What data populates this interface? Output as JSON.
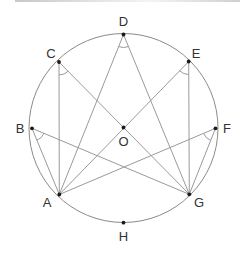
{
  "diagram": {
    "type": "inscribed-angles-circle",
    "circle": {
      "center_label": "O",
      "cx": 123.5,
      "cy": 128,
      "r": 94.5
    },
    "points": [
      {
        "label": "A",
        "x": 59.3,
        "y": 194.5,
        "lx": 47,
        "ly": 207
      },
      {
        "label": "B",
        "x": 32,
        "y": 128.3,
        "lx": 20,
        "ly": 133
      },
      {
        "label": "C",
        "x": 59,
        "y": 62,
        "lx": 51,
        "ly": 58
      },
      {
        "label": "D",
        "x": 123.5,
        "y": 34.5,
        "lx": 123.5,
        "ly": 26
      },
      {
        "label": "E",
        "x": 188.7,
        "y": 61.5,
        "lx": 196,
        "ly": 58
      },
      {
        "label": "F",
        "x": 215.5,
        "y": 128.3,
        "lx": 227,
        "ly": 133
      },
      {
        "label": "G",
        "x": 189.3,
        "y": 194.3,
        "lx": 199,
        "ly": 207
      },
      {
        "label": "H",
        "x": 123.5,
        "y": 222.7,
        "lx": 123.5,
        "ly": 241
      },
      {
        "label": "O",
        "x": 123.5,
        "y": 127.5,
        "lx": 123.5,
        "ly": 146
      }
    ],
    "segments": [
      [
        "D",
        "A"
      ],
      [
        "D",
        "G"
      ],
      [
        "C",
        "A"
      ],
      [
        "C",
        "G"
      ],
      [
        "E",
        "A"
      ],
      [
        "E",
        "G"
      ],
      [
        "B",
        "A"
      ],
      [
        "B",
        "G"
      ],
      [
        "F",
        "A"
      ],
      [
        "F",
        "G"
      ]
    ],
    "marked_angles": [
      "ADG",
      "ACG",
      "AEG",
      "ABG",
      "AFG"
    ],
    "colors": {
      "line": "#9a9a9a",
      "circle": "#8a8a8a",
      "point": "#1a1a1a",
      "text": "#333333"
    }
  }
}
